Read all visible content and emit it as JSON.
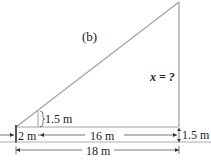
{
  "figure_label": "(b)",
  "unknown_label": "x = ?",
  "person_height_label": "1.5 m",
  "person_distance_label": "2 m",
  "middle_distance_label": "16 m",
  "eye_level_label": "1.5 m",
  "total_distance_label": "18 m",
  "colors": {
    "line": "#9a9a9a",
    "text": "#222222",
    "ground": "#777777"
  }
}
